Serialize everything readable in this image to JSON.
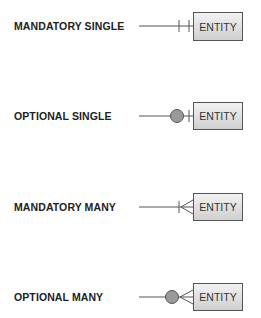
{
  "diagram": {
    "rows": [
      {
        "label": "MANDATORY SINGLE",
        "entity": "ENTITY",
        "symbol": "bar-bar"
      },
      {
        "label": "OPTIONAL SINGLE",
        "entity": "ENTITY",
        "symbol": "circle-bar"
      },
      {
        "label": "MANDATORY MANY",
        "entity": "ENTITY",
        "symbol": "bar-crowfoot"
      },
      {
        "label": "OPTIONAL MANY",
        "entity": "ENTITY",
        "symbol": "circle-crowfoot"
      }
    ],
    "colors": {
      "line": "#555555",
      "circle_fill": "#9a9a9a",
      "entity_fill_top": "#f2f2f2",
      "entity_fill_bottom": "#cfcfcf"
    }
  }
}
